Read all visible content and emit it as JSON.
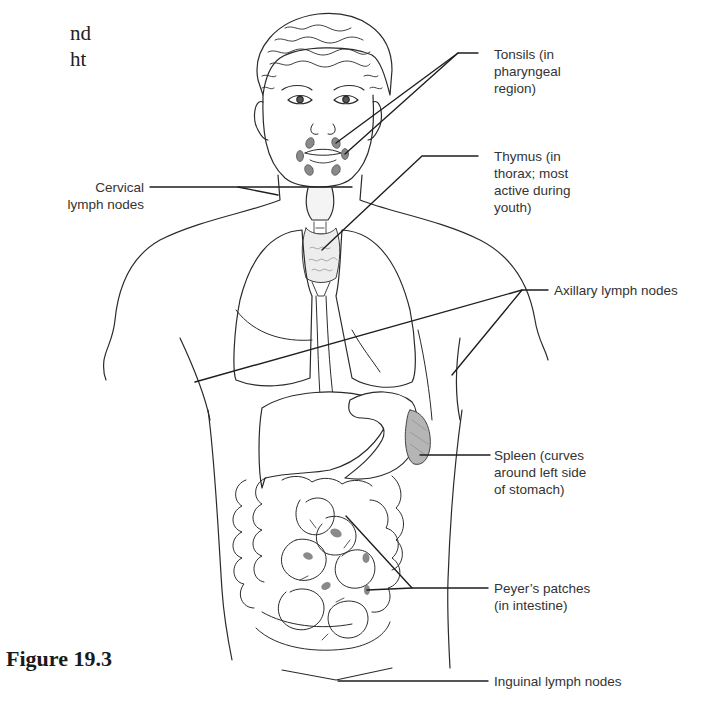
{
  "page_fragment": {
    "line1": "nd",
    "line2": "ht"
  },
  "figure": {
    "title": "Figure 19.3",
    "labels": {
      "tonsils": "Tonsils (in\npharyngeal\nregion)",
      "thymus": "Thymus (in\nthorax; most\nactive during\nyouth)",
      "cervical": "Cervical\nlymph nodes",
      "axillary": "Axillary lymph nodes",
      "spleen": "Spleen (curves\naround left side\nof stomach)",
      "peyers": "Peyer’s patches\n(in intestine)",
      "inguinal": "Inguinal lymph nodes"
    },
    "colors": {
      "line": "#2a2a2a",
      "organ_fill": "#ffffff",
      "lymph_tissue": "#8a8a8a",
      "spleen_fill": "#b5b5b5",
      "label_text": "#333333"
    }
  }
}
